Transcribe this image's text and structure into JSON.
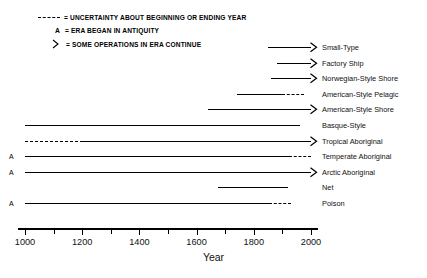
{
  "chart_data": {
    "type": "timeline",
    "title": "",
    "xlabel": "Year",
    "ylabel": "",
    "xlim": [
      950,
      2050
    ],
    "axis_ticks": [
      1000,
      1200,
      1400,
      1600,
      1800,
      2000
    ],
    "grid": false,
    "legend_position": "top-left",
    "legend": [
      {
        "key": "dashed-line",
        "symbol": "----",
        "text": "= UNCERTAINTY ABOUT BEGINNING OR ENDING YEAR"
      },
      {
        "key": "antiquity-letter",
        "symbol": "A",
        "text": "= ERA BEGAN IN ANTIQUITY"
      },
      {
        "key": "arrow-chevron",
        "symbol": ">",
        "text": "= SOME OPERATIONS IN ERA CONTINUE"
      }
    ],
    "categories": [
      "Small-Type",
      "Factory Ship",
      "Norwegian-Style Shore",
      "American-Style Pelagic",
      "American-Style Shore",
      "Basque-Style",
      "Tropical Aboriginal",
      "Temperate Aboriginal",
      "Arctic Aboriginal",
      "Net",
      "Poison"
    ],
    "rows": [
      {
        "label": "Small-Type",
        "start_year": 1850,
        "end_year": 2000,
        "antiquity": false,
        "continues": true,
        "start_uncertain": false,
        "end_uncertain": false
      },
      {
        "label": "Factory Ship",
        "start_year": 1880,
        "end_year": 2000,
        "antiquity": false,
        "continues": true,
        "start_uncertain": false,
        "end_uncertain": false
      },
      {
        "label": "Norwegian-Style Shore",
        "start_year": 1860,
        "end_year": 2000,
        "antiquity": false,
        "continues": true,
        "start_uncertain": false,
        "end_uncertain": false
      },
      {
        "label": "American-Style Pelagic",
        "start_year": 1740,
        "end_year": 1975,
        "antiquity": false,
        "continues": false,
        "start_uncertain": false,
        "end_uncertain": true
      },
      {
        "label": "American-Style Shore",
        "start_year": 1640,
        "end_year": 2000,
        "antiquity": false,
        "continues": true,
        "start_uncertain": false,
        "end_uncertain": false
      },
      {
        "label": "Basque-Style",
        "start_year": 1000,
        "end_year": 1960,
        "antiquity": false,
        "continues": false,
        "start_uncertain": false,
        "end_uncertain": false
      },
      {
        "label": "Tropical Aboriginal",
        "start_year": 1000,
        "end_year": 2000,
        "antiquity": false,
        "continues": true,
        "start_uncertain": true,
        "end_uncertain": false
      },
      {
        "label": "Temperate Aboriginal",
        "start_year": 1000,
        "end_year": 2000,
        "antiquity": true,
        "continues": false,
        "start_uncertain": false,
        "end_uncertain": true
      },
      {
        "label": "Arctic Aboriginal",
        "start_year": 1000,
        "end_year": 2000,
        "antiquity": true,
        "continues": true,
        "start_uncertain": false,
        "end_uncertain": false
      },
      {
        "label": "Net",
        "start_year": 1675,
        "end_year": 1920,
        "antiquity": false,
        "continues": false,
        "start_uncertain": false,
        "end_uncertain": false
      },
      {
        "label": "Poison",
        "start_year": 1000,
        "end_year": 1930,
        "antiquity": true,
        "continues": false,
        "start_uncertain": false,
        "end_uncertain": true
      }
    ]
  }
}
